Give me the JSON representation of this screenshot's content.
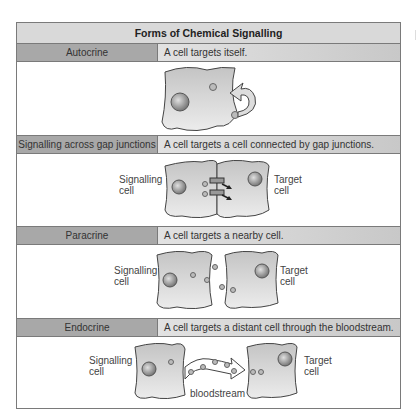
{
  "title": "Forms of Chemical Signalling",
  "rows": [
    {
      "name": "Autocrine",
      "description": "A cell targets itself."
    },
    {
      "name": "Signalling across gap junctions",
      "description": "A cell targets a cell connected by gap junctions.",
      "signalling_label_1": "Signalling",
      "signalling_label_2": "cell",
      "target_label_1": "Target",
      "target_label_2": "cell"
    },
    {
      "name": "Paracrine",
      "description": "A cell targets a nearby cell.",
      "signalling_label_1": "Signalling",
      "signalling_label_2": "cell",
      "target_label_1": "Target",
      "target_label_2": "cell"
    },
    {
      "name": "Endocrine",
      "description": "A cell targets a distant cell through the bloodstream.",
      "signalling_label_1": "Signalling",
      "signalling_label_2": "cell",
      "target_label_1": "Target",
      "target_label_2": "cell",
      "stream_label": "bloodstream"
    }
  ],
  "colors": {
    "name_cell_bg": "#a8a8a8",
    "title_bg": "#d9d9d9",
    "border": "#7a7a7a",
    "cell_fill": "#d6d6d6"
  }
}
